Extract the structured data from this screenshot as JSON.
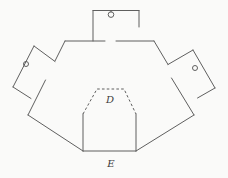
{
  "canvas": {
    "width": 228,
    "height": 178,
    "background": "#fafaf9"
  },
  "style": {
    "stroke": "#5f5f5f",
    "stroke_width": 1,
    "dash_pattern": "2.6 2.2",
    "label_color": "#3c3c3c",
    "label_font_size": 10
  },
  "labels": [
    {
      "name": "label-d",
      "text": "D",
      "x": 110,
      "y": 103
    },
    {
      "name": "label-e",
      "text": "E",
      "x": 111,
      "y": 167
    }
  ],
  "solid_segments": [
    {
      "name": "main-top-edge-left",
      "pts": [
        65,
        41,
        105,
        41
      ]
    },
    {
      "name": "main-top-edge-right",
      "pts": [
        116,
        41,
        154,
        41
      ]
    },
    {
      "name": "main-upper-right-slope-a",
      "pts": [
        154,
        41,
        168,
        64.5
      ]
    },
    {
      "name": "main-upper-right-slope-b",
      "pts": [
        171.5,
        78,
        194,
        115
      ]
    },
    {
      "name": "main-lower-right-slope",
      "pts": [
        194,
        115,
        136,
        151
      ]
    },
    {
      "name": "main-bottom-edge",
      "pts": [
        136,
        151,
        83,
        151
      ]
    },
    {
      "name": "main-lower-left-slope",
      "pts": [
        83,
        151,
        28,
        115
      ]
    },
    {
      "name": "main-upper-left-slope-a",
      "pts": [
        28,
        115,
        45.5,
        80
      ]
    },
    {
      "name": "main-upper-left-slope-b",
      "pts": [
        55,
        61,
        65,
        41
      ]
    },
    {
      "name": "top-flap-left-edge",
      "pts": [
        93,
        41,
        93,
        10.5
      ]
    },
    {
      "name": "top-flap-top-edge",
      "pts": [
        93,
        10.5,
        139,
        10.5
      ]
    },
    {
      "name": "top-flap-right-edge",
      "pts": [
        139,
        10.5,
        139,
        27
      ]
    },
    {
      "name": "top-flap-hole-stem",
      "pts": [
        111,
        10.5,
        111,
        12
      ]
    },
    {
      "name": "left-flap-top-edge",
      "pts": [
        34,
        46,
        55,
        61.5
      ]
    },
    {
      "name": "left-flap-outer-edge",
      "pts": [
        34,
        46,
        13,
        87
      ]
    },
    {
      "name": "left-flap-bottom-edge",
      "pts": [
        13,
        87,
        31,
        98.5
      ]
    },
    {
      "name": "right-flap-top-edge",
      "pts": [
        168,
        64.5,
        193,
        50
      ]
    },
    {
      "name": "right-flap-outer-edge",
      "pts": [
        193,
        50,
        215,
        88
      ]
    },
    {
      "name": "right-flap-bottom-edge",
      "pts": [
        215,
        88,
        197.5,
        98
      ]
    },
    {
      "name": "inner-pocket-left-edge",
      "pts": [
        83,
        151,
        83,
        114
      ]
    },
    {
      "name": "inner-pocket-right-edge",
      "pts": [
        136,
        151,
        136,
        114
      ]
    }
  ],
  "dashed_polylines": [
    {
      "name": "inner-pocket-fold-outline",
      "pts": [
        83,
        114,
        97,
        89,
        124,
        89,
        136,
        114
      ]
    }
  ],
  "circles": [
    {
      "name": "top-flap-hole",
      "cx": 111,
      "cy": 14.6,
      "r": 2.8
    },
    {
      "name": "left-flap-hole",
      "cx": 26,
      "cy": 64,
      "r": 2.5
    },
    {
      "name": "right-flap-hole",
      "cx": 195,
      "cy": 68,
      "r": 2.5
    }
  ]
}
